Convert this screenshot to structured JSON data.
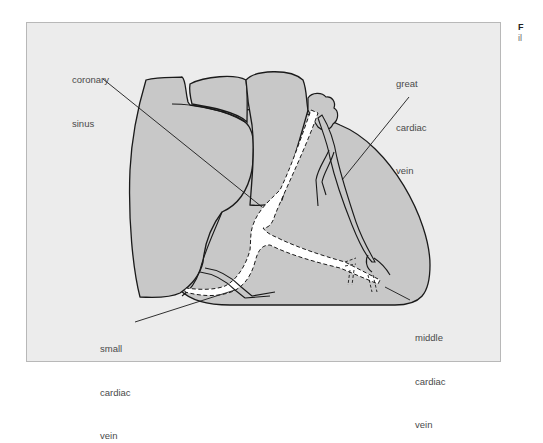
{
  "figure": {
    "type": "anatomical line drawing",
    "colors": {
      "panel_background": "#ececec",
      "panel_border": "#b8b8b8",
      "heart_fill": "#c8c8c8",
      "outline": "#1a1a1a",
      "sinus_fill": "#ffffff",
      "label_text": "#4a4a4a"
    },
    "labels": {
      "coronary_sinus": {
        "line1": "coronary",
        "line2": "sinus"
      },
      "great_cardiac_vein": {
        "line1": "great",
        "line2": "cardiac",
        "line3": "vein"
      },
      "small_cardiac_vein": {
        "line1": "small",
        "line2": "cardiac",
        "line3": "vein"
      },
      "middle_cardiac_vein": {
        "line1": "middle",
        "line2": "cardiac",
        "line3": "vein"
      }
    },
    "side_caption": {
      "line1": "F",
      "line2": "il"
    }
  }
}
